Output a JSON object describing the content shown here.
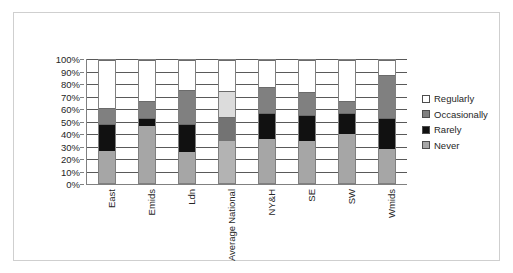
{
  "chart_data": {
    "type": "bar",
    "subtype": "stacked-bar-100",
    "title": "",
    "xlabel": "",
    "ylabel": "",
    "ylim": [
      0,
      100
    ],
    "ytick_labels": [
      "0%",
      "10%",
      "20%",
      "30%",
      "40%",
      "50%",
      "60%",
      "70%",
      "80%",
      "90%",
      "100%"
    ],
    "ytick_values": [
      0,
      10,
      20,
      30,
      40,
      50,
      60,
      70,
      80,
      90,
      100
    ],
    "grid": true,
    "legend_position": "right",
    "categories": [
      "East",
      "Emids",
      "Ldn",
      "National Average",
      "NY&H",
      "SE",
      "SW",
      "Wmids"
    ],
    "category_lines": [
      [
        "East"
      ],
      [
        "Emids"
      ],
      [
        "Ldn"
      ],
      [
        "National",
        "Average"
      ],
      [
        "NY&H"
      ],
      [
        "SE"
      ],
      [
        "SW"
      ],
      [
        "Wmids"
      ]
    ],
    "series": [
      {
        "name": "Never",
        "color": "#a6a6a6",
        "values": [
          26,
          46,
          25,
          34,
          36,
          34,
          40,
          28
        ]
      },
      {
        "name": "Rarely",
        "color": "#111111",
        "values": [
          22,
          7,
          23,
          20,
          21,
          21,
          17,
          25
        ]
      },
      {
        "name": "Occasionally",
        "color": "#808080",
        "values": [
          13,
          14,
          28,
          21,
          21,
          19,
          10,
          35
        ]
      },
      {
        "name": "Regularly",
        "color": "#ffffff",
        "values": [
          39,
          33,
          24,
          25,
          22,
          26,
          33,
          12
        ]
      }
    ],
    "series_cumulative_tops": {
      "Never": [
        26,
        46,
        25,
        34,
        36,
        34,
        40,
        28
      ],
      "Rarely": [
        48,
        53,
        48,
        54,
        57,
        55,
        57,
        53
      ],
      "Occasionally": [
        61,
        67,
        76,
        75,
        78,
        74,
        67,
        88
      ],
      "Regularly": [
        100,
        100,
        100,
        100,
        100,
        100,
        100,
        100
      ]
    },
    "category_overrides": {
      "National Average": {
        "Never": "#b3b3b3",
        "Rarely": "#737373",
        "Occasionally": "#dcdcdc",
        "Regularly": "#ffffff"
      }
    }
  },
  "legend": {
    "items": [
      {
        "label": "Regularly",
        "color": "#ffffff"
      },
      {
        "label": "Occasionally",
        "color": "#808080"
      },
      {
        "label": "Rarely",
        "color": "#111111"
      },
      {
        "label": "Never",
        "color": "#a6a6a6"
      }
    ]
  },
  "colors": {
    "frame_border": "#cfcfcf",
    "axis": "#808080",
    "gridline": "#595959",
    "text": "#262626",
    "background": "#ffffff"
  }
}
